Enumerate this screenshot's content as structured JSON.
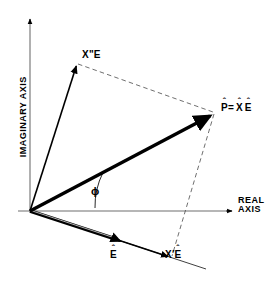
{
  "figure": {
    "type": "phasor-diagram",
    "background_color": "#ffffff",
    "line_color": "#000000",
    "axis_color": "#6f6f6f"
  },
  "axes": {
    "imaginary": {
      "label": "IMAGINARY AXIS",
      "orientation": "vertical",
      "arrow": "up"
    },
    "real": {
      "label_line1": "REAL",
      "label_line2": "AXIS",
      "orientation": "horizontal",
      "arrow": "right"
    }
  },
  "labels": {
    "x_double_prime_E": {
      "base": "X",
      "prime": "\"",
      "tail": "E"
    },
    "p_equals_xe": {
      "p": "P",
      "equals": "=",
      "x": "X",
      "e": "E",
      "hat": "ˆ"
    },
    "e_hat": {
      "base": "E",
      "hat": "ˆ"
    },
    "x_prime_E_hat": {
      "base": "X",
      "prime": "′",
      "tail": "E",
      "hat": "ˆ"
    },
    "phi": "ϕ"
  },
  "vectors": [
    {
      "name": "x-double-prime-E-vector",
      "label": "X\"E",
      "style": "thin-solid-arrow",
      "from": [
        30,
        211
      ],
      "to": [
        77,
        63
      ]
    },
    {
      "name": "p-hat-vector",
      "label": "P̂ = X̂ Ê",
      "style": "thick-solid-arrow",
      "from": [
        30,
        211
      ],
      "to": [
        215,
        113
      ]
    },
    {
      "name": "e-hat-vector",
      "label": "Ê",
      "style": "double-line-arrow",
      "from": [
        30,
        211
      ],
      "to": [
        120,
        243
      ]
    },
    {
      "name": "x-prime-E-hat-vector",
      "label": "X′Ê",
      "style": "thin-solid-arrow",
      "from": [
        30,
        211
      ],
      "to": [
        172,
        258
      ]
    }
  ],
  "construction_lines": [
    {
      "name": "dashed-top-construction-line",
      "style": "dashed",
      "from": [
        77,
        63
      ],
      "to": [
        215,
        113
      ]
    },
    {
      "name": "dashed-right-construction-line",
      "style": "dashed",
      "from": [
        215,
        113
      ],
      "to": [
        172,
        258
      ]
    },
    {
      "name": "e-axis-extension-line",
      "style": "thin-solid",
      "from": [
        172,
        258
      ],
      "to": [
        205,
        269
      ]
    }
  ],
  "angle": {
    "name": "phi-angle",
    "symbol": "ϕ",
    "between": [
      "e-hat-vector",
      "p-hat-vector"
    ],
    "vertex": [
      30,
      211
    ]
  }
}
